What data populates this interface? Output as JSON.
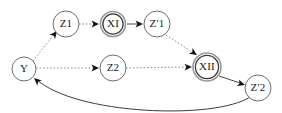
{
  "diagram": {
    "background_color": "#ffffff",
    "canvas": {
      "width": 282,
      "height": 113
    },
    "node_style": {
      "plain_stroke": "#6f6f6f",
      "double_outer_stroke": "#9a9a9a",
      "double_inner_stroke": "#3a3a3a",
      "fill": "#ffffff",
      "label_color": "#1a1a1a"
    },
    "edge_style": {
      "dotted_stroke": "#8d8d8d",
      "solid_stroke": "#4a4a4a",
      "curve_stroke": "#3d3d3d",
      "arrowhead_fill": "#141414"
    },
    "nodes": [
      {
        "id": "Y",
        "label": "Y",
        "cx": 24,
        "cy": 69,
        "r": 12,
        "shape": "circle"
      },
      {
        "id": "Z1",
        "label": "Z1",
        "cx": 66,
        "cy": 24,
        "r": 13,
        "shape": "circle"
      },
      {
        "id": "XI",
        "label": "XI",
        "cx": 113,
        "cy": 24,
        "r": 12.5,
        "shape": "double-circle"
      },
      {
        "id": "Zp1",
        "label": "Z'1",
        "cx": 157,
        "cy": 24,
        "r": 13,
        "shape": "circle"
      },
      {
        "id": "Z2",
        "label": "Z2",
        "cx": 113,
        "cy": 68,
        "r": 13,
        "shape": "circle"
      },
      {
        "id": "XII",
        "label": "XII",
        "cx": 207,
        "cy": 67,
        "r": 14,
        "shape": "double-circle"
      },
      {
        "id": "Zp2",
        "label": "Z'2",
        "cx": 258,
        "cy": 88,
        "r": 13,
        "shape": "circle"
      }
    ],
    "edges": [
      {
        "id": "e-y-z1",
        "from": "Y",
        "to": "Z1",
        "style": "dotted",
        "arrow": true,
        "path": "M 33 61 L 55 33"
      },
      {
        "id": "e-z1-xi",
        "from": "Z1",
        "to": "XI",
        "style": "dotted",
        "arrow": true,
        "path": "M 79 24 L 97 24"
      },
      {
        "id": "e-xi-zp1",
        "from": "XI",
        "to": "Zp1",
        "style": "solid",
        "arrow": true,
        "path": "M 127 24 L 141 24"
      },
      {
        "id": "e-zp1-xii",
        "from": "Zp1",
        "to": "XII",
        "style": "dotted",
        "arrow": true,
        "path": "M 166 35 L 195 54"
      },
      {
        "id": "e-y-z2",
        "from": "Y",
        "to": "Z2",
        "style": "dotted",
        "arrow": true,
        "path": "M 36 68 L 97 68"
      },
      {
        "id": "e-z2-xii",
        "from": "Z2",
        "to": "XII",
        "style": "dotted",
        "arrow": true,
        "path": "M 126 68 L 190 67"
      },
      {
        "id": "e-xii-zp2",
        "from": "XII",
        "to": "Zp2",
        "style": "solid",
        "arrow": true,
        "path": "M 219 76 L 243 84"
      },
      {
        "id": "e-zp2-y",
        "from": "Zp2",
        "to": "Y",
        "style": "curve",
        "arrow": true,
        "path": "M 250 97 C 215 120, 75 115, 36 79"
      }
    ],
    "arrowheads": [
      {
        "id": "a-y-z1",
        "x": 57,
        "y": 31,
        "angle": -52
      },
      {
        "id": "a-z1-xi",
        "x": 99,
        "y": 24,
        "angle": 0
      },
      {
        "id": "a-xi-zp1",
        "x": 143,
        "y": 24,
        "angle": 0
      },
      {
        "id": "a-zp1-xii",
        "x": 197,
        "y": 55,
        "angle": 33
      },
      {
        "id": "a-y-z2",
        "x": 99,
        "y": 68,
        "angle": 0
      },
      {
        "id": "a-z2-xii",
        "x": 192,
        "y": 67,
        "angle": -1
      },
      {
        "id": "a-xii-zp2",
        "x": 245,
        "y": 85,
        "angle": 18
      },
      {
        "id": "a-zp2-y",
        "x": 34,
        "y": 78,
        "angle": 222
      }
    ]
  }
}
